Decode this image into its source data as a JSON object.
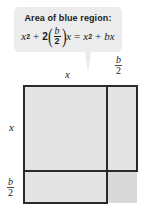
{
  "callout": {
    "title": "Area of blue region:",
    "formula": {
      "term1_base": "x",
      "term1_exp": "2",
      "plus1": "+",
      "coef": "2",
      "frac_num": "b",
      "frac_den": "2",
      "var": "x",
      "equals": "=",
      "rhs_base": "x",
      "rhs_exp": "2",
      "plus2": "+",
      "rhs_term": "bx"
    },
    "background_color": "#ececec"
  },
  "diagram": {
    "top_label_x": "x",
    "top_label_half_b": {
      "num": "b",
      "den": "2"
    },
    "left_label_x": "x",
    "left_label_half_b": {
      "num": "b",
      "den": "2"
    },
    "region_color": "#e4e4e4",
    "corner_color": "#d9d9d9",
    "line_color": "#2a2a2a"
  }
}
